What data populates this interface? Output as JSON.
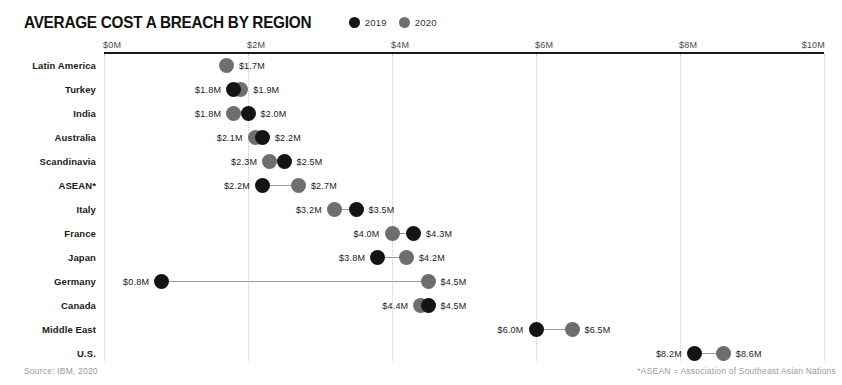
{
  "chart_data": {
    "type": "scatter",
    "title": "AVERAGE COST A BREACH BY REGION",
    "subtitle": "",
    "xlabel": "",
    "ylabel": "",
    "xlim": [
      0,
      10
    ],
    "xticks": [
      0,
      2,
      4,
      6,
      8,
      10
    ],
    "xtick_labels": [
      "$0M",
      "$2M",
      "$4M",
      "$6M",
      "$8M",
      "$10M"
    ],
    "grid": true,
    "legend_position": "top",
    "legend": [
      {
        "name": "2019",
        "color": "#141414"
      },
      {
        "name": "2020",
        "color": "#6e6e6e"
      }
    ],
    "categories": [
      "Latin America",
      "Turkey",
      "India",
      "Australia",
      "Scandinavia",
      "ASEAN*",
      "Italy",
      "France",
      "Japan",
      "Germany",
      "Canada",
      "Middle East",
      "U.S."
    ],
    "series": [
      {
        "name": "2019",
        "values": [
          null,
          1.8,
          2.0,
          2.2,
          2.5,
          2.2,
          3.5,
          4.3,
          3.8,
          0.8,
          4.5,
          6.0,
          8.2
        ]
      },
      {
        "name": "2020",
        "values": [
          1.7,
          1.9,
          1.8,
          2.1,
          2.3,
          2.7,
          3.2,
          4.0,
          4.2,
          4.5,
          4.4,
          6.5,
          8.6
        ]
      }
    ],
    "points": [
      {
        "category": "Latin America",
        "y2019": null,
        "y2020": 1.7,
        "label_2019": "",
        "label_2020": "$1.7M",
        "left_label": "",
        "right_label": "$1.7M"
      },
      {
        "category": "Turkey",
        "y2019": 1.8,
        "y2020": 1.9,
        "label_2019": "$1.8M",
        "label_2020": "$1.9M",
        "left_label": "$1.8M",
        "right_label": "$1.9M"
      },
      {
        "category": "India",
        "y2019": 2.0,
        "y2020": 1.8,
        "label_2019": "$2.0M",
        "label_2020": "$1.8M",
        "left_label": "$1.8M",
        "right_label": "$2.0M"
      },
      {
        "category": "Australia",
        "y2019": 2.2,
        "y2020": 2.1,
        "label_2019": "$2.2M",
        "label_2020": "$2.1M",
        "left_label": "$2.1M",
        "right_label": "$2.2M"
      },
      {
        "category": "Scandinavia",
        "y2019": 2.5,
        "y2020": 2.3,
        "label_2019": "$2.5M",
        "label_2020": "$2.3M",
        "left_label": "$2.3M",
        "right_label": "$2.5M"
      },
      {
        "category": "ASEAN*",
        "y2019": 2.2,
        "y2020": 2.7,
        "label_2019": "$2.2M",
        "label_2020": "$2.7M",
        "left_label": "$2.2M",
        "right_label": "$2.7M"
      },
      {
        "category": "Italy",
        "y2019": 3.5,
        "y2020": 3.2,
        "label_2019": "$3.5M",
        "label_2020": "$3.2M",
        "left_label": "$3.2M",
        "right_label": "$3.5M"
      },
      {
        "category": "France",
        "y2019": 4.3,
        "y2020": 4.0,
        "label_2019": "$4.3M",
        "label_2020": "$4.0M",
        "left_label": "$4.0M",
        "right_label": "$4.3M"
      },
      {
        "category": "Japan",
        "y2019": 3.8,
        "y2020": 4.2,
        "label_2019": "$3.8M",
        "label_2020": "$4.2M",
        "left_label": "$3.8M",
        "right_label": "$4.2M"
      },
      {
        "category": "Germany",
        "y2019": 0.8,
        "y2020": 4.5,
        "label_2019": "$0.8M",
        "label_2020": "$4.5M",
        "left_label": "$0.8M",
        "right_label": "$4.5M"
      },
      {
        "category": "Canada",
        "y2019": 4.5,
        "y2020": 4.4,
        "label_2019": "$4.5M",
        "label_2020": "$4.4M",
        "left_label": "$4.4M",
        "right_label": "$4.5M"
      },
      {
        "category": "Middle East",
        "y2019": 6.0,
        "y2020": 6.5,
        "label_2019": "$6.0M",
        "label_2020": "$6.5M",
        "left_label": "$6.0M",
        "right_label": "$6.5M"
      },
      {
        "category": "U.S.",
        "y2019": 8.2,
        "y2020": 8.6,
        "label_2019": "$8.2M",
        "label_2020": "$8.6M",
        "left_label": "$8.2M",
        "right_label": "$8.6M"
      }
    ]
  },
  "footer": {
    "source": "Source: IBM, 2020",
    "footnote": "*ASEAN = Association of Southeast Asian Nations"
  },
  "colors": {
    "series_2019": "#141414",
    "series_2020": "#6e6e6e",
    "axis": "#1a1a1a",
    "grid": "#c9c9c9",
    "muted_text": "#9a9a9a"
  }
}
